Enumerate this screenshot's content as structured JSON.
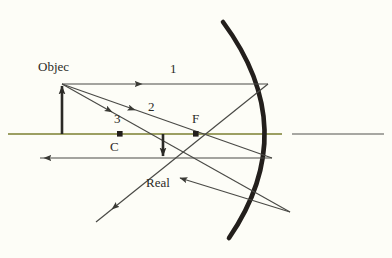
{
  "figure": {
    "kind": "concave-mirror-ray-diagram",
    "background_color": "#fdfdf7",
    "ink_color": "#2b2a26",
    "ray_color": "#4a4a46",
    "axis_color_left": "#7b7f32",
    "axis_color_right": "#8a8a86",
    "mirror_color": "#231f1c"
  },
  "labels": {
    "object": "Objec",
    "ray1": "1",
    "ray2": "2",
    "ray3": "3",
    "center_of_curvature": "C",
    "focal_point": "F",
    "image": "Real"
  },
  "geometry": {
    "axis_y": 134,
    "axis_left_x": 8,
    "axis_left_end_x": 282,
    "axis_right_start_x": 292,
    "axis_right_end_x": 384,
    "mirror_vertex_x": 278,
    "mirror_top": {
      "x": 223,
      "y": 22
    },
    "mirror_bottom": {
      "x": 229,
      "y": 238
    },
    "object_base": {
      "x": 62,
      "y": 134
    },
    "object_tip": {
      "x": 62,
      "y": 84
    },
    "image_base": {
      "x": 163,
      "y": 134
    },
    "image_tip": {
      "x": 163,
      "y": 160
    },
    "point_c": {
      "x": 120,
      "y": 134
    },
    "point_f": {
      "x": 196,
      "y": 134
    },
    "convergence": {
      "x": 163,
      "y": 160
    }
  }
}
